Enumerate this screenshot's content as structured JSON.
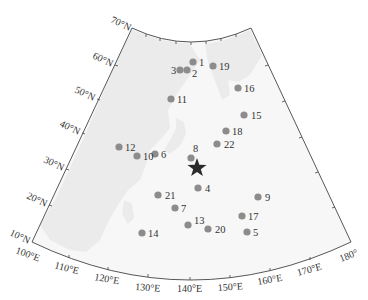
{
  "map": {
    "type": "conic-projection-map",
    "colors": {
      "land": "#ebebeb",
      "ocean": "#f7f7f7",
      "frame": "#444444",
      "station": "#8c8c8c",
      "star": "#2b2b2b",
      "label": "#333333"
    },
    "lat_labels": [
      {
        "text": "70°N",
        "x": 132,
        "y": 28
      },
      {
        "text": "60°N",
        "x": 115,
        "y": 65
      },
      {
        "text": "50°N",
        "x": 97,
        "y": 99
      },
      {
        "text": "40°N",
        "x": 82,
        "y": 133
      },
      {
        "text": "30°N",
        "x": 66,
        "y": 169
      },
      {
        "text": "20°N",
        "x": 49,
        "y": 205
      },
      {
        "text": "10°N",
        "x": 32,
        "y": 242
      }
    ],
    "lon_labels": [
      {
        "text": "100°E",
        "x": 32,
        "y": 242
      },
      {
        "text": "110°E",
        "x": 69,
        "y": 258
      },
      {
        "text": "120°E",
        "x": 108,
        "y": 270
      },
      {
        "text": "130°E",
        "x": 148,
        "y": 277
      },
      {
        "text": "140°E",
        "x": 190,
        "y": 280
      },
      {
        "text": "150°E",
        "x": 230,
        "y": 278
      },
      {
        "text": "160°E",
        "x": 270,
        "y": 271
      },
      {
        "text": "170°E",
        "x": 310,
        "y": 260
      },
      {
        "text": "180°",
        "x": 351,
        "y": 242
      }
    ],
    "stations": [
      {
        "id": "1",
        "x": 193,
        "y": 62,
        "lx": 199,
        "ly": 66
      },
      {
        "id": "2",
        "x": 187,
        "y": 70,
        "lx": 192,
        "ly": 77
      },
      {
        "id": "3",
        "x": 180,
        "y": 70,
        "lx": 171,
        "ly": 74
      },
      {
        "id": "4",
        "x": 198,
        "y": 188,
        "lx": 205,
        "ly": 192
      },
      {
        "id": "5",
        "x": 247,
        "y": 232,
        "lx": 253,
        "ly": 236
      },
      {
        "id": "6",
        "x": 155,
        "y": 154,
        "lx": 161,
        "ly": 158
      },
      {
        "id": "7",
        "x": 175,
        "y": 208,
        "lx": 181,
        "ly": 212
      },
      {
        "id": "8",
        "x": 191,
        "y": 158,
        "lx": 193,
        "ly": 152
      },
      {
        "id": "9",
        "x": 258,
        "y": 197,
        "lx": 265,
        "ly": 201
      },
      {
        "id": "10",
        "x": 137,
        "y": 156,
        "lx": 143,
        "ly": 160
      },
      {
        "id": "11",
        "x": 171,
        "y": 99,
        "lx": 177,
        "ly": 103
      },
      {
        "id": "12",
        "x": 119,
        "y": 147,
        "lx": 125,
        "ly": 151
      },
      {
        "id": "13",
        "x": 188,
        "y": 225,
        "lx": 194,
        "ly": 224
      },
      {
        "id": "14",
        "x": 142,
        "y": 233,
        "lx": 148,
        "ly": 237
      },
      {
        "id": "15",
        "x": 244,
        "y": 115,
        "lx": 251,
        "ly": 119
      },
      {
        "id": "16",
        "x": 238,
        "y": 88,
        "lx": 244,
        "ly": 92
      },
      {
        "id": "17",
        "x": 242,
        "y": 216,
        "lx": 248,
        "ly": 220
      },
      {
        "id": "18",
        "x": 226,
        "y": 131,
        "lx": 232,
        "ly": 135
      },
      {
        "id": "19",
        "x": 213,
        "y": 66,
        "lx": 219,
        "ly": 70
      },
      {
        "id": "20",
        "x": 208,
        "y": 229,
        "lx": 215,
        "ly": 233
      },
      {
        "id": "21",
        "x": 158,
        "y": 195,
        "lx": 165,
        "ly": 199
      },
      {
        "id": "22",
        "x": 217,
        "y": 144,
        "lx": 224,
        "ly": 148
      }
    ],
    "star": {
      "name": "epicenter-star",
      "x": 197,
      "y": 168
    }
  }
}
